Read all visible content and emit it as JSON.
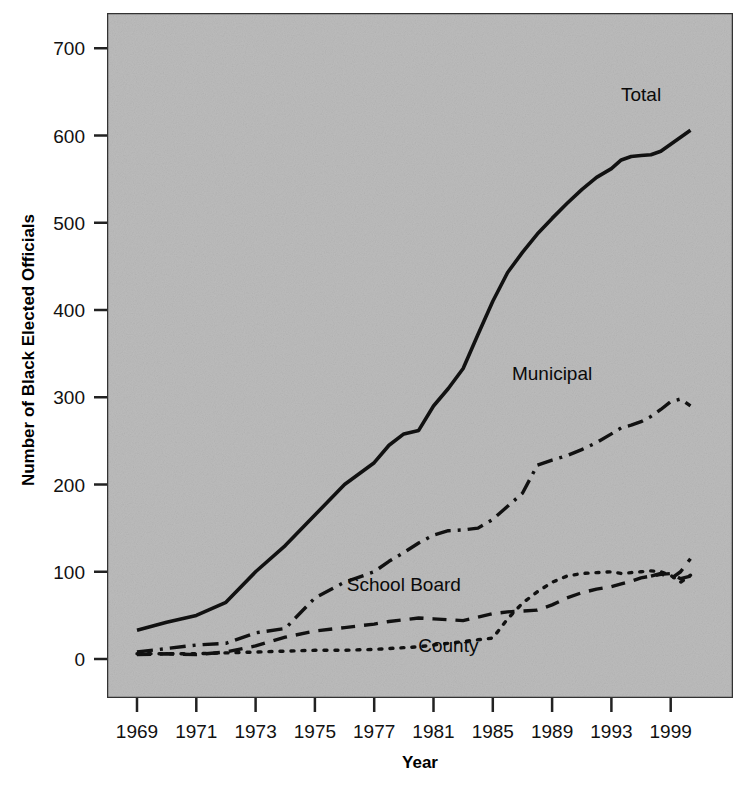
{
  "chart_data": {
    "type": "line",
    "title": "",
    "xlabel": "Year",
    "ylabel": "Number of Black Elected Officials",
    "xlim": [
      1969,
      2001
    ],
    "ylim": [
      0,
      750
    ],
    "grid": false,
    "legend_position": "inline-labels",
    "background_color": "#bcbcbc",
    "line_color": "#111111",
    "x_tick_labels": [
      "1969",
      "1971",
      "1973",
      "1975",
      "1977",
      "1981",
      "1985",
      "1989",
      "1993",
      "1999"
    ],
    "x_tick_years": [
      1969,
      1971,
      1973,
      1975,
      1977,
      1981,
      1985,
      1989,
      1993,
      1999
    ],
    "y_tick_labels": [
      "0",
      "100",
      "200",
      "300",
      "400",
      "500",
      "600",
      "700"
    ],
    "y_tick_values": [
      0,
      100,
      200,
      300,
      400,
      500,
      600,
      700
    ],
    "x": [
      1969,
      1970,
      1971,
      1972,
      1973,
      1974,
      1975,
      1976,
      1977,
      1978,
      1979,
      1980,
      1981,
      1982,
      1983,
      1984,
      1985,
      1986,
      1987,
      1988,
      1989,
      1990,
      1991,
      1992,
      1993,
      1994,
      1995,
      1996,
      1997,
      1998,
      1999,
      2000,
      2001
    ],
    "series": [
      {
        "name": "Total",
        "label": "Total",
        "line_style": "solid",
        "values": [
          33,
          42,
          50,
          65,
          100,
          130,
          165,
          200,
          225,
          245,
          258,
          262,
          290,
          310,
          333,
          372,
          410,
          443,
          466,
          487,
          505,
          522,
          538,
          552,
          562,
          572,
          576,
          577,
          578,
          582,
          590,
          598,
          606
        ]
      },
      {
        "name": "Municipal",
        "label": "Municipal",
        "line_style": "dash-dot",
        "values": [
          8,
          12,
          16,
          18,
          30,
          35,
          70,
          88,
          100,
          112,
          122,
          133,
          142,
          147,
          148,
          150,
          160,
          175,
          190,
          222,
          228,
          233,
          240,
          248,
          258,
          265,
          268,
          272,
          278,
          286,
          295,
          298,
          290
        ]
      },
      {
        "name": "School Board",
        "label": "School Board",
        "line_style": "dashed",
        "values": [
          5,
          6,
          5,
          8,
          15,
          25,
          32,
          36,
          40,
          43,
          45,
          47,
          46,
          45,
          44,
          48,
          52,
          54,
          55,
          56,
          62,
          70,
          76,
          80,
          83,
          86,
          89,
          93,
          95,
          97,
          98,
          92,
          95
        ]
      },
      {
        "name": "County",
        "label": "County",
        "line_style": "dotted",
        "values": [
          6,
          6,
          6,
          7,
          8,
          9,
          10,
          10,
          11,
          12,
          13,
          14,
          16,
          18,
          20,
          22,
          24,
          46,
          64,
          77,
          88,
          95,
          98,
          99,
          100,
          98,
          99,
          100,
          101,
          100,
          96,
          88,
          96
        ]
      },
      {
        "name": "School Board Tail",
        "label": "",
        "line_style": "dashed",
        "values": [
          null,
          null,
          null,
          null,
          null,
          null,
          null,
          null,
          null,
          null,
          null,
          null,
          null,
          null,
          null,
          null,
          null,
          null,
          null,
          null,
          null,
          null,
          null,
          null,
          null,
          null,
          null,
          null,
          95,
          98,
          92,
          100,
          115
        ]
      }
    ],
    "annotations": [
      {
        "text": "Total",
        "x": 1996,
        "y": 640,
        "name": "total-series-label"
      },
      {
        "text": "Municipal",
        "x": 1989,
        "y": 320,
        "name": "municipal-series-label"
      },
      {
        "text": "School Board",
        "x": 1979,
        "y": 78,
        "name": "school-board-series-label"
      },
      {
        "text": "County",
        "x": 1982,
        "y": 8,
        "name": "county-series-label"
      }
    ]
  }
}
